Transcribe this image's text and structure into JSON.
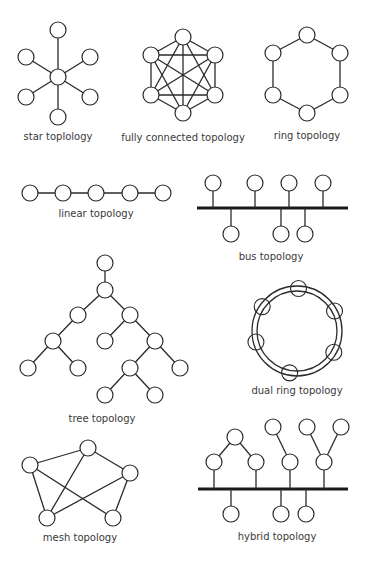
{
  "diagrams": [
    {
      "id": "star",
      "label": "star toplology"
    },
    {
      "id": "full",
      "label": "fully connected topology"
    },
    {
      "id": "ring",
      "label": "ring topology"
    },
    {
      "id": "linear",
      "label": "linear topology"
    },
    {
      "id": "bus",
      "label": "bus topology"
    },
    {
      "id": "tree",
      "label": "tree topology"
    },
    {
      "id": "dualring",
      "label": "dual ring topology"
    },
    {
      "id": "mesh",
      "label": "mesh topology"
    },
    {
      "id": "hybrid",
      "label": "hybrid topology"
    }
  ],
  "structure": {
    "star": {
      "nodes": 7,
      "hub": 1,
      "spokes": 6
    },
    "full": {
      "nodes": 6,
      "edges": "all pairs"
    },
    "ring": {
      "nodes": 6
    },
    "linear": {
      "nodes": 5
    },
    "bus": {
      "nodes_above": 4,
      "nodes_below": 3
    },
    "tree": {
      "nodes": 13
    },
    "dualring": {
      "nodes": 6,
      "rings": 2
    },
    "mesh": {
      "nodes": 5,
      "edges": 7
    },
    "hybrid": {
      "bus_nodes_below": 3,
      "bus_nodes_above": 4,
      "subtree_nodes": 4
    }
  }
}
